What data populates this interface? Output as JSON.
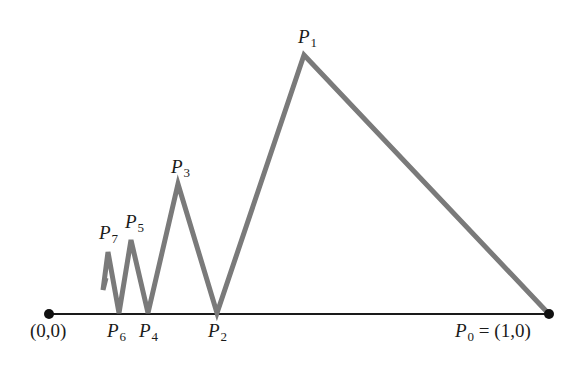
{
  "diagram": {
    "colors": {
      "axis": "#1a1a1a",
      "path": "#7a7a7a",
      "endpoint": "#111111",
      "background": "#ffffff"
    },
    "axis": {
      "x1": 49,
      "y1": 314,
      "x2": 549,
      "y2": 314
    },
    "endpoints": [
      {
        "name": "origin",
        "x": 49,
        "y": 314,
        "label": "(0,0)"
      },
      {
        "name": "unit",
        "x": 549,
        "y": 314,
        "label": "(1,0)"
      }
    ],
    "polyline_points": "548,313 304,55 217,313 178,184 148,313 131,240 119,313 108,252 103,290 106,278",
    "labels": {
      "origin": "(0,0)",
      "p0_letter": "P",
      "p0_sub": "0",
      "p0_eq": " = (1,0)",
      "p1_letter": "P",
      "p1_sub": "1",
      "p2_letter": "P",
      "p2_sub": "2",
      "p3_letter": "P",
      "p3_sub": "3",
      "p4_letter": "P",
      "p4_sub": "4",
      "p5_letter": "P",
      "p5_sub": "5",
      "p6_letter": "P",
      "p6_sub": "6",
      "p7_letter": "P",
      "p7_sub": "7"
    }
  }
}
